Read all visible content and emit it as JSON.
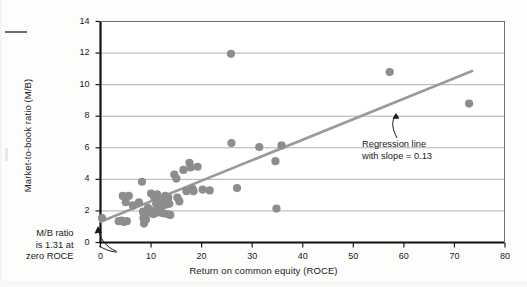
{
  "chart_data": {
    "type": "scatter",
    "title": "",
    "xlabel": "Return on common equity (ROCE)",
    "ylabel": "Market-to-book ratio (M/B)",
    "xlim": [
      0,
      80
    ],
    "ylim": [
      0,
      14
    ],
    "xticks": [
      0,
      10,
      20,
      30,
      40,
      50,
      60,
      70,
      80
    ],
    "yticks": [
      0,
      2,
      4,
      6,
      8,
      10,
      12,
      14
    ],
    "grid": "horizontal",
    "legend": "none",
    "marker_color": "#8d8d8d",
    "line_color": "#9a9a9a",
    "series": [
      {
        "name": "Companies",
        "points": [
          [
            0.3,
            1.55
          ],
          [
            3.6,
            1.35
          ],
          [
            4.2,
            1.38
          ],
          [
            4.4,
            2.95
          ],
          [
            4.6,
            1.3
          ],
          [
            5.0,
            2.55
          ],
          [
            5.2,
            1.35
          ],
          [
            5.6,
            2.95
          ],
          [
            6.4,
            2.35
          ],
          [
            7.6,
            2.55
          ],
          [
            8.2,
            3.85
          ],
          [
            8.4,
            1.95
          ],
          [
            8.5,
            1.55
          ],
          [
            8.6,
            1.2
          ],
          [
            8.8,
            1.7
          ],
          [
            9.0,
            1.45
          ],
          [
            9.4,
            2.2
          ],
          [
            9.6,
            1.9
          ],
          [
            10.0,
            3.1
          ],
          [
            10.2,
            2.0
          ],
          [
            10.4,
            1.8
          ],
          [
            10.6,
            2.9
          ],
          [
            10.8,
            1.85
          ],
          [
            11.0,
            2.45
          ],
          [
            11.2,
            3.05
          ],
          [
            11.4,
            1.95
          ],
          [
            11.6,
            2.35
          ],
          [
            11.8,
            1.9
          ],
          [
            12.0,
            2.6
          ],
          [
            12.2,
            2.3
          ],
          [
            12.4,
            1.85
          ],
          [
            12.6,
            2.55
          ],
          [
            12.8,
            2.95
          ],
          [
            13.0,
            2.4
          ],
          [
            13.2,
            1.8
          ],
          [
            13.4,
            2.85
          ],
          [
            13.6,
            2.45
          ],
          [
            13.8,
            1.75
          ],
          [
            14.6,
            4.3
          ],
          [
            15.0,
            4.05
          ],
          [
            15.2,
            2.85
          ],
          [
            15.6,
            2.6
          ],
          [
            16.4,
            4.6
          ],
          [
            17.0,
            3.25
          ],
          [
            17.6,
            5.05
          ],
          [
            17.8,
            4.75
          ],
          [
            18.2,
            3.4
          ],
          [
            18.4,
            3.25
          ],
          [
            19.2,
            4.8
          ],
          [
            20.2,
            3.35
          ],
          [
            21.6,
            3.3
          ],
          [
            25.8,
            11.95
          ],
          [
            25.9,
            6.3
          ],
          [
            27.0,
            3.45
          ],
          [
            31.4,
            6.05
          ],
          [
            34.6,
            5.15
          ],
          [
            34.8,
            2.15
          ],
          [
            35.8,
            6.15
          ],
          [
            57.2,
            10.8
          ],
          [
            72.9,
            8.8
          ]
        ]
      }
    ],
    "regression_line": {
      "label_line1": "Regression line",
      "label_line2": "with slope = 0.13",
      "intercept": 1.31,
      "slope": 0.13,
      "x_start": 0,
      "x_end": 73.5
    },
    "annotations": [
      {
        "name": "origin-annotation",
        "line1": "M/B ratio",
        "line2": "is 1.31 at",
        "line3": "zero ROCE"
      }
    ]
  }
}
